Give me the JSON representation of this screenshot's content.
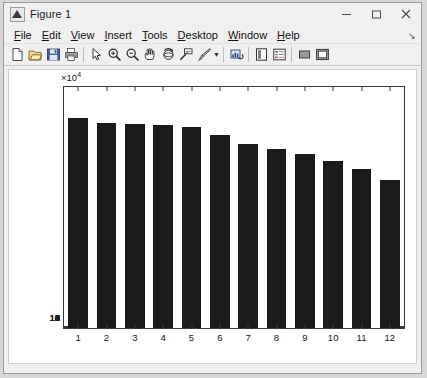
{
  "window": {
    "title": "Figure 1",
    "icon": "matlab-figure-icon",
    "controls": [
      {
        "name": "minimize",
        "glyph": "minimize-icon"
      },
      {
        "name": "maximize",
        "glyph": "maximize-icon"
      },
      {
        "name": "close",
        "glyph": "close-icon"
      }
    ]
  },
  "menubar": {
    "items": [
      {
        "label": "File",
        "mnemonic": "F"
      },
      {
        "label": "Edit",
        "mnemonic": "E"
      },
      {
        "label": "View",
        "mnemonic": "V"
      },
      {
        "label": "Insert",
        "mnemonic": "I"
      },
      {
        "label": "Tools",
        "mnemonic": "T"
      },
      {
        "label": "Desktop",
        "mnemonic": "D"
      },
      {
        "label": "Window",
        "mnemonic": "W"
      },
      {
        "label": "Help",
        "mnemonic": "H"
      }
    ],
    "overflow_glyph": "↘"
  },
  "toolbar": {
    "buttons": [
      {
        "name": "new-figure-icon",
        "title": "New Figure"
      },
      {
        "name": "open-file-icon",
        "title": "Open File"
      },
      {
        "name": "save-figure-icon",
        "title": "Save Figure"
      },
      {
        "name": "print-figure-icon",
        "title": "Print Figure"
      },
      {
        "name": "separator",
        "title": ""
      },
      {
        "name": "edit-plot-pointer-icon",
        "title": "Edit Plot"
      },
      {
        "name": "zoom-in-icon",
        "title": "Zoom In"
      },
      {
        "name": "zoom-out-icon",
        "title": "Zoom Out"
      },
      {
        "name": "pan-hand-icon",
        "title": "Pan"
      },
      {
        "name": "rotate-3d-icon",
        "title": "Rotate 3D"
      },
      {
        "name": "data-cursor-icon",
        "title": "Data Cursor"
      },
      {
        "name": "brush-data-icon",
        "title": "Brush/Select Data"
      },
      {
        "name": "brush-dropdown-caret",
        "title": ""
      },
      {
        "name": "separator",
        "title": ""
      },
      {
        "name": "link-plot-icon",
        "title": "Link Plot"
      },
      {
        "name": "separator",
        "title": ""
      },
      {
        "name": "colorbar-icon",
        "title": "Insert Colorbar"
      },
      {
        "name": "legend-icon",
        "title": "Insert Legend"
      },
      {
        "name": "separator",
        "title": ""
      },
      {
        "name": "hide-plot-tools-icon",
        "title": "Hide Plot Tools"
      },
      {
        "name": "show-plot-tools-icon",
        "title": "Show Plot Tools and Dock Figure"
      }
    ]
  },
  "chart_data": {
    "type": "bar",
    "title": "",
    "xlabel": "",
    "ylabel": "",
    "categories": [
      "1",
      "2",
      "3",
      "4",
      "5",
      "6",
      "7",
      "8",
      "9",
      "10",
      "11",
      "12"
    ],
    "values": [
      122000,
      119000,
      118500,
      118000,
      117000,
      112000,
      107000,
      104000,
      101000,
      97000,
      92500,
      86000
    ],
    "y_exponent_label": "×10",
    "y_exponent_power": "4",
    "y_tick_values": [
      0,
      2,
      4,
      6,
      8,
      10,
      12,
      14
    ],
    "y_tick_labels": [
      "0",
      "2",
      "4",
      "6",
      "8",
      "10",
      "12",
      "14"
    ],
    "ylim": [
      0,
      140000
    ],
    "xlim": [
      0.5,
      12.5
    ],
    "grid": false,
    "legend": null,
    "bar_color": "#1b1b1b",
    "axes_color": "#3a3a3a",
    "background": "#ffffff"
  }
}
